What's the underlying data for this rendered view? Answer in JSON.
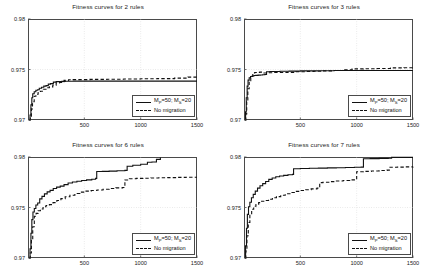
{
  "figure": {
    "background": "#ffffff",
    "axis_color": "#4a4a4a",
    "grid_color": "#cccccc",
    "series_color": "#111111"
  },
  "legend": {
    "series_solid_label": "Mᴘ=50; Mₛ=20",
    "series_solid_main": "M",
    "series_solid_sub1": "P",
    "series_solid_mid": "=50; M",
    "series_solid_sub2": "S",
    "series_solid_end": "=20",
    "series_dashed_label": "No migration"
  },
  "chart_data": [
    {
      "id": "panel-2-rules",
      "type": "line",
      "title": "Fitness curves for 2 rules",
      "xlabel": "",
      "ylabel": "",
      "xlim": [
        0,
        1500
      ],
      "ylim": [
        0.97,
        0.98
      ],
      "xticks": [
        500,
        1000,
        1500
      ],
      "xtick_labels": [
        "500",
        "1000",
        "1500"
      ],
      "yticks": [
        0.97,
        0.975,
        0.98
      ],
      "ytick_labels": [
        "0.97",
        "0.975",
        "0.98"
      ],
      "grid": true,
      "legend_position": "lower right",
      "series": [
        {
          "name": "Mᴘ=50; Mₛ=20",
          "style": "solid",
          "x": [
            10,
            18,
            26,
            34,
            42,
            55,
            70,
            85,
            100,
            120,
            140,
            160,
            180,
            200,
            225,
            250,
            275,
            300,
            330,
            360,
            400,
            500,
            700,
            900,
            1100,
            1300,
            1500
          ],
          "y": [
            0.97,
            0.9705,
            0.9715,
            0.9722,
            0.9726,
            0.9728,
            0.97295,
            0.973,
            0.97315,
            0.97325,
            0.97335,
            0.9734,
            0.97355,
            0.9736,
            0.97375,
            0.9738,
            0.9738,
            0.97382,
            0.97383,
            0.97384,
            0.97385,
            0.97385,
            0.97385,
            0.97385,
            0.97385,
            0.97385,
            0.97385
          ]
        },
        {
          "name": "No migration",
          "style": "dashed",
          "x": [
            10,
            20,
            30,
            40,
            55,
            70,
            90,
            110,
            135,
            160,
            190,
            220,
            250,
            280,
            320,
            360,
            400,
            450,
            550,
            700,
            850,
            1000,
            1150,
            1300,
            1420,
            1500
          ],
          "y": [
            0.97,
            0.9702,
            0.9711,
            0.9718,
            0.97235,
            0.97255,
            0.97272,
            0.97285,
            0.97305,
            0.9732,
            0.97328,
            0.97345,
            0.97368,
            0.97372,
            0.97392,
            0.97398,
            0.974,
            0.974,
            0.97402,
            0.97404,
            0.97406,
            0.97408,
            0.9741,
            0.97415,
            0.97425,
            0.97428
          ]
        }
      ]
    },
    {
      "id": "panel-3-rules",
      "type": "line",
      "title": "Fitness curves for 3 rules",
      "xlabel": "",
      "ylabel": "",
      "xlim": [
        0,
        1500
      ],
      "ylim": [
        0.97,
        0.98
      ],
      "xticks": [
        500,
        1000,
        1500
      ],
      "xtick_labels": [
        "500",
        "1000",
        "1500"
      ],
      "yticks": [
        0.97,
        0.975,
        0.98
      ],
      "ytick_labels": [
        "0.97",
        "0.975",
        "0.98"
      ],
      "grid": true,
      "legend_position": "lower right",
      "series": [
        {
          "name": "Mᴘ=50; Mₛ=20",
          "style": "solid",
          "x": [
            8,
            14,
            20,
            28,
            36,
            46,
            58,
            72,
            88,
            105,
            125,
            145,
            165,
            185,
            200,
            230,
            270,
            320,
            400,
            500,
            650,
            800,
            1000,
            1200,
            1400,
            1500
          ],
          "y": [
            0.97,
            0.9708,
            0.9722,
            0.97335,
            0.97395,
            0.97418,
            0.9743,
            0.97435,
            0.9744,
            0.97442,
            0.97444,
            0.97446,
            0.97448,
            0.9745,
            0.97478,
            0.9748,
            0.9748,
            0.97482,
            0.97484,
            0.97486,
            0.97488,
            0.9749,
            0.9749,
            0.9749,
            0.9749,
            0.9749
          ]
        },
        {
          "name": "No migration",
          "style": "dashed",
          "x": [
            8,
            16,
            24,
            34,
            46,
            60,
            78,
            95,
            115,
            140,
            165,
            190,
            220,
            260,
            310,
            380,
            460,
            540,
            620,
            700,
            800,
            880,
            960,
            1060,
            1180,
            1300,
            1420,
            1500
          ],
          "y": [
            0.97,
            0.9706,
            0.9718,
            0.9731,
            0.9739,
            0.9743,
            0.97465,
            0.9747,
            0.97472,
            0.97474,
            0.97466,
            0.97466,
            0.97468,
            0.9747,
            0.9747,
            0.97472,
            0.97478,
            0.9748,
            0.97482,
            0.97486,
            0.9749,
            0.97498,
            0.97506,
            0.97508,
            0.9751,
            0.97516,
            0.97518,
            0.9752
          ]
        }
      ]
    },
    {
      "id": "panel-6-rules",
      "type": "line",
      "title": "Fitness curves for 6 rules",
      "xlabel": "",
      "ylabel": "",
      "xlim": [
        0,
        1500
      ],
      "ylim": [
        0.97,
        0.98
      ],
      "xticks": [
        500,
        1000,
        1500
      ],
      "xtick_labels": [
        "500",
        "1000",
        "1500"
      ],
      "yticks": [
        0.97,
        0.975,
        0.98
      ],
      "ytick_labels": [
        "0.97",
        "0.975",
        "0.98"
      ],
      "grid": true,
      "legend_position": "lower right",
      "series": [
        {
          "name": "Mᴘ=50; Mₛ=20",
          "style": "solid",
          "x": [
            10,
            18,
            26,
            34,
            44,
            56,
            70,
            86,
            104,
            124,
            146,
            170,
            196,
            224,
            254,
            286,
            320,
            356,
            394,
            434,
            476,
            520,
            566,
            600,
            610,
            660,
            720,
            790,
            860,
            880,
            930,
            1000,
            1060,
            1100,
            1140,
            1175
          ],
          "y": [
            0.97,
            0.9709,
            0.97245,
            0.9738,
            0.97455,
            0.9749,
            0.97525,
            0.97545,
            0.97585,
            0.9761,
            0.97635,
            0.97655,
            0.9767,
            0.97688,
            0.97702,
            0.97712,
            0.97726,
            0.97742,
            0.97752,
            0.9776,
            0.97768,
            0.97774,
            0.9778,
            0.97788,
            0.97856,
            0.97858,
            0.9786,
            0.97864,
            0.97868,
            0.97908,
            0.97918,
            0.97928,
            0.97948,
            0.9795,
            0.97976,
            0.97995
          ]
        },
        {
          "name": "No migration",
          "style": "dashed",
          "x": [
            10,
            20,
            30,
            42,
            56,
            72,
            90,
            110,
            134,
            160,
            190,
            222,
            256,
            292,
            330,
            372,
            416,
            462,
            510,
            560,
            612,
            666,
            722,
            780,
            840,
            860,
            900,
            960,
            1020,
            1090,
            1160,
            1240,
            1320,
            1400,
            1470,
            1500
          ],
          "y": [
            0.97,
            0.9705,
            0.97185,
            0.9731,
            0.97412,
            0.97442,
            0.97468,
            0.97485,
            0.97508,
            0.9752,
            0.97528,
            0.97548,
            0.9757,
            0.97588,
            0.97606,
            0.97622,
            0.97638,
            0.97652,
            0.97662,
            0.97668,
            0.97674,
            0.9768,
            0.97688,
            0.97694,
            0.97698,
            0.97772,
            0.97784,
            0.97788,
            0.9779,
            0.97792,
            0.97794,
            0.97796,
            0.97798,
            0.978,
            0.978,
            0.978
          ]
        }
      ]
    },
    {
      "id": "panel-7-rules",
      "type": "line",
      "title": "Fitness curves for 7 rules",
      "xlabel": "",
      "ylabel": "",
      "xlim": [
        0,
        1500
      ],
      "ylim": [
        0.97,
        0.98
      ],
      "xticks": [
        500,
        1000,
        1500
      ],
      "xtick_labels": [
        "500",
        "1000",
        "1500"
      ],
      "yticks": [
        0.97,
        0.975,
        0.98
      ],
      "ytick_labels": [
        "0.97",
        "0.975",
        "0.98"
      ],
      "grid": true,
      "legend_position": "lower right",
      "series": [
        {
          "name": "Mᴘ=50; Mₛ=20",
          "style": "solid",
          "x": [
            8,
            14,
            22,
            30,
            40,
            52,
            66,
            82,
            100,
            120,
            142,
            166,
            192,
            220,
            250,
            282,
            316,
            352,
            390,
            430,
            440,
            500,
            580,
            660,
            740,
            820,
            900,
            980,
            1040,
            1060,
            1120,
            1200,
            1280,
            1310,
            1400,
            1500
          ],
          "y": [
            0.97,
            0.9712,
            0.97295,
            0.97432,
            0.97508,
            0.97552,
            0.97596,
            0.9763,
            0.97662,
            0.97692,
            0.97716,
            0.97736,
            0.97758,
            0.97778,
            0.97792,
            0.97804,
            0.97812,
            0.97818,
            0.97824,
            0.97828,
            0.97884,
            0.97886,
            0.97888,
            0.9789,
            0.97892,
            0.97894,
            0.97896,
            0.97898,
            0.979,
            0.97982,
            0.97984,
            0.97986,
            0.97988,
            0.97996,
            0.97996,
            0.97996
          ]
        },
        {
          "name": "No migration",
          "style": "dashed",
          "x": [
            8,
            16,
            26,
            38,
            52,
            68,
            86,
            106,
            130,
            156,
            186,
            218,
            252,
            288,
            326,
            366,
            408,
            452,
            498,
            546,
            596,
            648,
            672,
            700,
            760,
            820,
            880,
            940,
            990,
            1000,
            1060,
            1130,
            1200,
            1270,
            1290,
            1360,
            1430,
            1500
          ],
          "y": [
            0.97,
            0.9707,
            0.9722,
            0.97352,
            0.97438,
            0.97482,
            0.97512,
            0.9753,
            0.97548,
            0.97562,
            0.9757,
            0.97582,
            0.97596,
            0.97608,
            0.97622,
            0.97636,
            0.97648,
            0.9766,
            0.97668,
            0.97676,
            0.97684,
            0.97692,
            0.97746,
            0.9775,
            0.97756,
            0.97762,
            0.97768,
            0.97774,
            0.97778,
            0.97854,
            0.97858,
            0.97862,
            0.97866,
            0.9787,
            0.97898,
            0.979,
            0.97902,
            0.97904
          ]
        }
      ]
    }
  ]
}
